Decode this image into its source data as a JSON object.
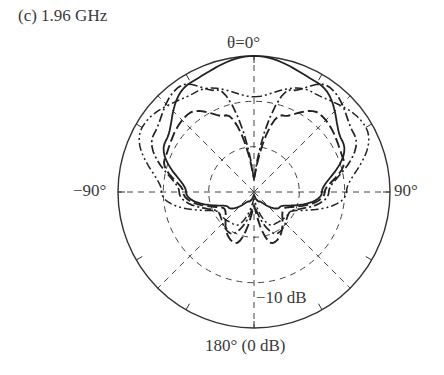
{
  "chart_data": {
    "type": "polar",
    "title": "(c) 1.96 GHz",
    "angle_labels": {
      "top": "θ=0°",
      "left": "−90°",
      "right": "90°",
      "bottom": "180° (0 dB)"
    },
    "radial_labels": [
      "−10 dB"
    ],
    "radial_scale": {
      "outer": "0 dB",
      "rings": [
        "0 dB",
        "−10 dB",
        "−20 dB"
      ],
      "ring_fractions": [
        1.0,
        0.667,
        0.333
      ]
    },
    "grid": {
      "spokes_deg": [
        0,
        45,
        90,
        135,
        180,
        225,
        270,
        315
      ],
      "tick_interval_deg": 30,
      "grid_style": "dashed"
    },
    "series": [
      {
        "name": "pattern-1 (solid)",
        "style": "solid",
        "description": "main lobe toward θ=0°, peak 0 dB, null at 180°",
        "points_deg_norm": [
          [
            0,
            1.0
          ],
          [
            30,
            0.93
          ],
          [
            60,
            0.75
          ],
          [
            90,
            0.5
          ],
          [
            120,
            0.22
          ],
          [
            150,
            0.08
          ],
          [
            180,
            0.02
          ]
        ]
      },
      {
        "name": "pattern-2 (dash-dot)",
        "style": "dash-dot",
        "description": "split lobes near ±30°, null at 0°",
        "points_deg_norm": [
          [
            0,
            0.1
          ],
          [
            20,
            0.8
          ],
          [
            35,
            0.95
          ],
          [
            60,
            0.85
          ],
          [
            90,
            0.55
          ],
          [
            120,
            0.3
          ],
          [
            150,
            0.35
          ],
          [
            180,
            0.1
          ]
        ]
      },
      {
        "name": "pattern-3 (long dash)",
        "style": "dashed",
        "description": "split lobes near ±35°, smaller",
        "points_deg_norm": [
          [
            0,
            0.1
          ],
          [
            20,
            0.6
          ],
          [
            40,
            0.75
          ],
          [
            70,
            0.7
          ],
          [
            90,
            0.52
          ],
          [
            120,
            0.25
          ],
          [
            160,
            0.4
          ],
          [
            180,
            0.1
          ]
        ]
      },
      {
        "name": "pattern-4 (dash-dot-dot)",
        "style": "dash-dot-dot",
        "description": "broad lobe near ±60°",
        "points_deg_norm": [
          [
            0,
            0.7
          ],
          [
            30,
            0.85
          ],
          [
            60,
            0.95
          ],
          [
            90,
            0.68
          ],
          [
            120,
            0.3
          ],
          [
            150,
            0.28
          ],
          [
            180,
            0.05
          ]
        ]
      }
    ]
  }
}
